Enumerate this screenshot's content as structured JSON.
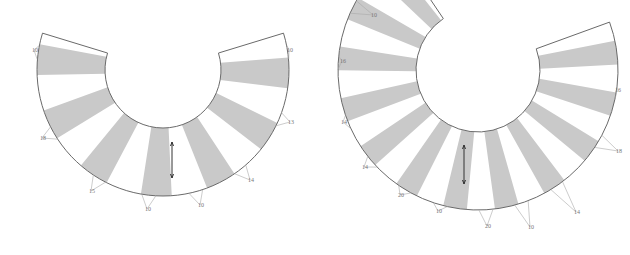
{
  "figure": {
    "colors": {
      "panel_fill": "#c9c9c9",
      "outline": "#6a6a6a",
      "label": "#777777",
      "grainline": "#333333"
    }
  },
  "pieces": [
    {
      "name": "left-pattern-piece",
      "center": [
        163,
        70
      ],
      "inner_radius": 58,
      "outer_radius": 126,
      "start_angle_deg": 197,
      "end_angle_deg": -17,
      "panels_count": 7,
      "grainline": {
        "x": 172,
        "y1": 142,
        "y2": 178
      },
      "labels": [
        {
          "text": "10",
          "x": 34,
          "y": 52
        },
        {
          "text": "18",
          "x": 42,
          "y": 140
        },
        {
          "text": "15",
          "x": 91,
          "y": 193
        },
        {
          "text": "10",
          "x": 147,
          "y": 211
        },
        {
          "text": "10",
          "x": 200,
          "y": 207
        },
        {
          "text": "14",
          "x": 250,
          "y": 182
        },
        {
          "text": "13",
          "x": 290,
          "y": 124
        },
        {
          "text": "10",
          "x": 289,
          "y": 52
        }
      ]
    },
    {
      "name": "right-pattern-piece",
      "center": [
        478,
        70
      ],
      "inner_radius": 62,
      "outer_radius": 140,
      "start_angle_deg": 236,
      "end_angle_deg": -20,
      "panels_count": 12,
      "grainline": {
        "x": 464,
        "y1": 145,
        "y2": 184
      },
      "labels": [
        {
          "text": "10",
          "x": 373,
          "y": 17
        },
        {
          "text": "16",
          "x": 342,
          "y": 63
        },
        {
          "text": "14",
          "x": 343,
          "y": 124
        },
        {
          "text": "14",
          "x": 364,
          "y": 169
        },
        {
          "text": "20",
          "x": 400,
          "y": 197
        },
        {
          "text": "10",
          "x": 438,
          "y": 213
        },
        {
          "text": "20",
          "x": 487,
          "y": 228
        },
        {
          "text": "10",
          "x": 530,
          "y": 229
        },
        {
          "text": "14",
          "x": 576,
          "y": 214
        },
        {
          "text": "18",
          "x": 618,
          "y": 153
        },
        {
          "text": "16",
          "x": 617,
          "y": 92
        }
      ]
    }
  ]
}
